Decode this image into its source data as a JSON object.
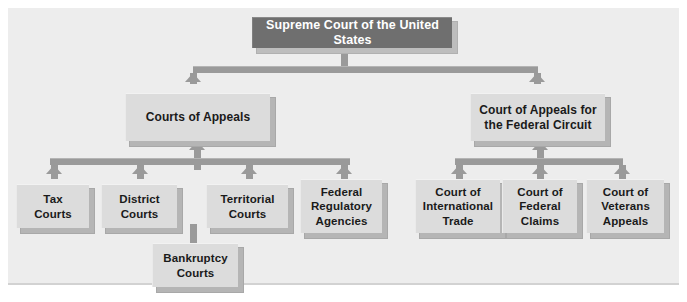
{
  "diagram": {
    "type": "hierarchy-flowchart",
    "flow_direction": "upward (appeals rise from lower courts to higher courts)",
    "colors": {
      "page_background": "#ffffff",
      "panel_background": "#ededed",
      "panel_border": "#d2d2d2",
      "top_node_fill": "#6f6f6f",
      "top_node_text": "#ffffff",
      "node_fill": "#dcdcdc",
      "node_text": "#1a1a1a",
      "node_shadow": "#b5b5b5",
      "connector": "#9a9a9a"
    },
    "tiers": {
      "supreme": {
        "label": "Supreme Court of the United States"
      },
      "appellate": [
        {
          "id": "courts-of-appeals",
          "label": "Courts of Appeals"
        },
        {
          "id": "federal-circuit",
          "label": "Court of Appeals for\nthe Federal Circuit"
        }
      ],
      "left_branch": [
        {
          "id": "tax-courts",
          "label": "Tax\nCourts"
        },
        {
          "id": "district-courts",
          "label": "District\nCourts"
        },
        {
          "id": "territorial-courts",
          "label": "Territorial\nCourts"
        },
        {
          "id": "federal-regulatory-agencies",
          "label": "Federal\nRegulatory\nAgencies"
        }
      ],
      "right_branch": [
        {
          "id": "court-of-international-trade",
          "label": "Court of\nInternational\nTrade"
        },
        {
          "id": "court-of-federal-claims",
          "label": "Court of\nFederal\nClaims"
        },
        {
          "id": "court-of-veterans-appeals",
          "label": "Court of\nVeterans\nAppeals"
        }
      ],
      "subordinate": [
        {
          "id": "bankruptcy-courts",
          "label": "Bankruptcy\nCourts",
          "feeds_into": "district-courts"
        }
      ]
    }
  }
}
